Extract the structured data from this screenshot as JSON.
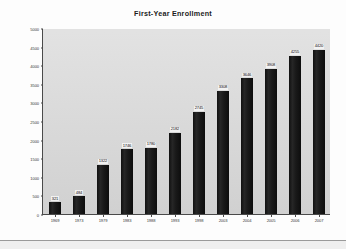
{
  "chart_data": {
    "type": "bar",
    "title": "First-Year Enrollment",
    "xlabel": "",
    "ylabel": "",
    "ylim": [
      0,
      5000
    ],
    "grid": false,
    "legend": "none",
    "categories": [
      "1969",
      "1973",
      "1979",
      "1983",
      "1988",
      "1993",
      "1998",
      "2003",
      "2004",
      "2005",
      "2006",
      "2007"
    ],
    "values": [
      321,
      484,
      1322,
      1746,
      1780,
      2182,
      2745,
      3308,
      3646,
      3908,
      4255,
      4420
    ],
    "value_labels": [
      "321",
      "484",
      "1322",
      "1746",
      "1780",
      "2182",
      "2745",
      "3308",
      "3646",
      "3908",
      "4255",
      "4420"
    ],
    "ytick_labels": [
      "0",
      "500",
      "1000",
      "1500",
      "2000",
      "2500",
      "3000",
      "3500",
      "4000",
      "4500",
      "5000"
    ],
    "ytick_values": [
      0,
      500,
      1000,
      1500,
      2000,
      2500,
      3000,
      3500,
      4000,
      4500,
      5000
    ],
    "bar_color": "#1a1a1a",
    "plot_background": "#dcdcdc",
    "page_background": "#fdfdfd",
    "axis_color": "#4a4a4a"
  }
}
